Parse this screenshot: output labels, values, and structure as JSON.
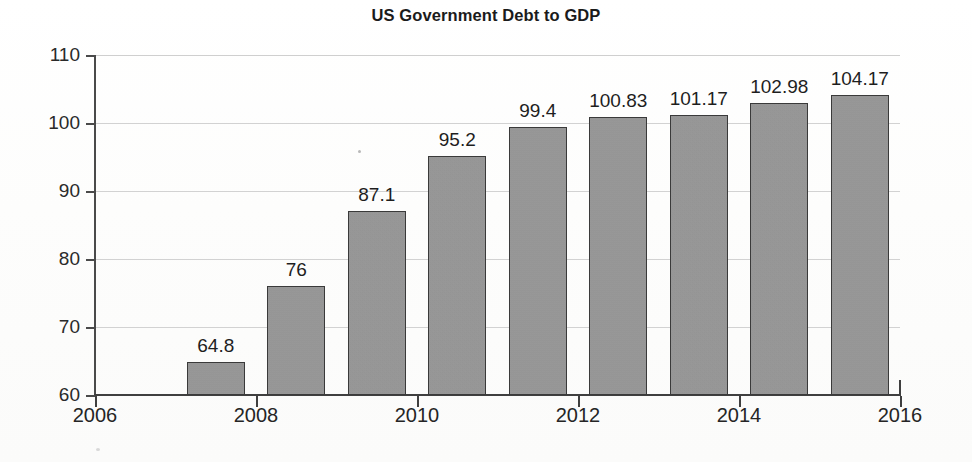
{
  "chart_data": {
    "type": "bar",
    "title": "US Government Debt to GDP",
    "xlabel": "",
    "ylabel": "",
    "categories": [
      "2007",
      "2008",
      "2009",
      "2010",
      "2011",
      "2012",
      "2013",
      "2014",
      "2015"
    ],
    "values": [
      64.8,
      76,
      87.1,
      95.2,
      99.4,
      100.83,
      101.17,
      102.98,
      104.17
    ],
    "value_labels": [
      "64.8",
      "76",
      "87.1",
      "95.2",
      "99.4",
      "100.83",
      "101.17",
      "102.98",
      "104.17"
    ],
    "ylim": [
      60,
      110
    ],
    "xlim": [
      2006,
      2016
    ],
    "y_ticks": [
      110,
      100,
      90,
      80,
      70,
      60
    ],
    "y_tick_labels": [
      "110",
      "100",
      "90",
      "80",
      "70",
      "60"
    ],
    "x_ticks": [
      2006,
      2008,
      2010,
      2012,
      2014,
      2016
    ],
    "x_tick_labels": [
      "2006",
      "2008",
      "2010",
      "2012",
      "2014",
      "2016"
    ],
    "grid": "horizontal",
    "legend": "none",
    "bar_color": "#989898",
    "bar_edge_color": "#3a3a3a",
    "gridline_color": "#d2d2d2",
    "axis_color": "#3f3f3f",
    "text_color": "#1e1e1e",
    "background_color": "#fdfdfd"
  }
}
